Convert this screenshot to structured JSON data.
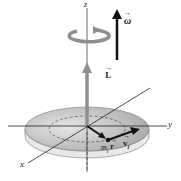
{
  "diagram": {
    "axes": {
      "z": "z",
      "y": "y",
      "x": "x"
    },
    "vectors": {
      "omega": {
        "label": "ω",
        "color": "#111111"
      },
      "L": {
        "label": "L",
        "color": "#8a8a8a"
      },
      "r": {
        "label": "r"
      },
      "v": {
        "label": "v",
        "subscript": "i"
      }
    },
    "mass": {
      "label": "m",
      "subscript": "i"
    },
    "colors": {
      "disk_top": "#c8c8c8",
      "disk_edge": "#e6e6e6",
      "axis": "#333333",
      "L_arrow": "#8f8f8f",
      "rotation_arrow": "#8f8f8f"
    }
  }
}
